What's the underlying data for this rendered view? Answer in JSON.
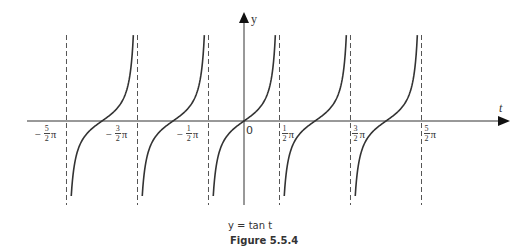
{
  "chart_data": {
    "type": "line",
    "title": "Figure 5.5.4",
    "function_label": "y = tan t",
    "xlabel": "t",
    "ylabel": "y",
    "origin_label": "0",
    "x_ticks": [
      {
        "sign": "−",
        "num": "5",
        "den": "2",
        "sym": "π",
        "value": -7.854
      },
      {
        "sign": "−",
        "num": "3",
        "den": "2",
        "sym": "π",
        "value": -4.712
      },
      {
        "sign": "−",
        "num": "1",
        "den": "2",
        "sym": "π",
        "value": -1.571
      },
      {
        "sign": "",
        "num": "1",
        "den": "2",
        "sym": "π",
        "value": 1.571
      },
      {
        "sign": "",
        "num": "3",
        "den": "2",
        "sym": "π",
        "value": 4.712
      },
      {
        "sign": "",
        "num": "5",
        "den": "2",
        "sym": "π",
        "value": 7.854
      }
    ],
    "asymptotes": [
      "-5/2π",
      "-3/2π",
      "-1/2π",
      "1/2π",
      "3/2π",
      "5/2π"
    ],
    "series": [
      {
        "name": "tan t",
        "branches": [
          {
            "from": "-5/2π",
            "to": "-3/2π",
            "center": "-2π"
          },
          {
            "from": "-3/2π",
            "to": "-1/2π",
            "center": "-π"
          },
          {
            "from": "-1/2π",
            "to": "1/2π",
            "center": "0"
          },
          {
            "from": "1/2π",
            "to": "3/2π",
            "center": "π"
          },
          {
            "from": "3/2π",
            "to": "5/2π",
            "center": "2π"
          }
        ]
      }
    ],
    "grid": false,
    "legend": "none"
  },
  "labels": {
    "y_axis": "y",
    "t_axis": "t",
    "origin": "0",
    "function": "y = tan t",
    "figure": "Figure 5.5.4"
  }
}
